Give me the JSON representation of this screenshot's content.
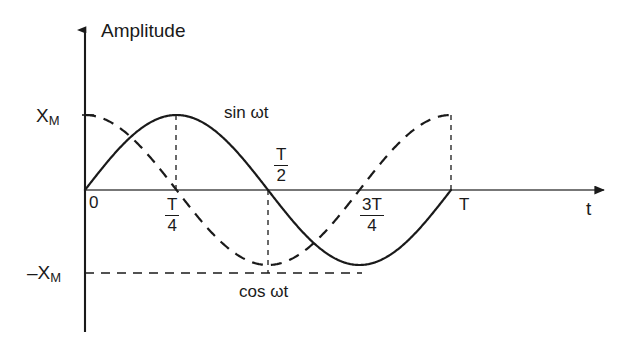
{
  "figure": {
    "background_color": "#ffffff",
    "line_color": "#1a1a1a",
    "y_axis_title": "Amplitude",
    "x_axis_title": "t",
    "origin_label": "0",
    "amplitude_labels": {
      "positive": "X",
      "positive_sub": "M",
      "negative": "–X",
      "negative_sub": "M"
    },
    "tick_labels": {
      "quarter_num": "T",
      "quarter_den": "4",
      "half_num": "T",
      "half_den": "2",
      "three_quarter_num": "3T",
      "three_quarter_den": "4",
      "period": "T"
    },
    "curve_labels": {
      "sine": "sin ωt",
      "cosine": "cos ωt"
    }
  },
  "chart_data": {
    "type": "line",
    "title": "",
    "xlabel": "t",
    "ylabel": "Amplitude",
    "xlim": [
      0,
      1.33
    ],
    "ylim": [
      -1.25,
      1.45
    ],
    "grid": false,
    "legend": "inline-annotations",
    "x_tick_labels": [
      "0",
      "T/4",
      "T/2",
      "3T/4",
      "T"
    ],
    "x_tick_values": [
      0,
      0.25,
      0.5,
      0.75,
      1.0
    ],
    "y_tick_labels": [
      "X_M",
      "0",
      "-X_M"
    ],
    "y_tick_values": [
      1,
      0,
      -1
    ],
    "series": [
      {
        "name": "sin ωt",
        "style": "solid",
        "x": [
          0,
          0.0625,
          0.125,
          0.1875,
          0.25,
          0.3125,
          0.375,
          0.4375,
          0.5,
          0.5625,
          0.625,
          0.6875,
          0.75,
          0.8125,
          0.875,
          0.9375,
          1.0
        ],
        "values": [
          0,
          0.3827,
          0.7071,
          0.9239,
          1.0,
          0.9239,
          0.7071,
          0.3827,
          0,
          -0.3827,
          -0.7071,
          -0.9239,
          -1.0,
          -0.9239,
          -0.7071,
          -0.3827,
          0
        ]
      },
      {
        "name": "cos ωt",
        "style": "dashed",
        "x": [
          0,
          0.0625,
          0.125,
          0.1875,
          0.25,
          0.3125,
          0.375,
          0.4375,
          0.5,
          0.5625,
          0.625,
          0.6875,
          0.75,
          0.8125,
          0.875,
          0.9375,
          1.0
        ],
        "values": [
          1.0,
          0.9239,
          0.7071,
          0.3827,
          0,
          -0.3827,
          -0.7071,
          -0.9239,
          -1.0,
          -0.9239,
          -0.7071,
          -0.3827,
          0,
          0.3827,
          0.7071,
          0.9239,
          1.0
        ]
      }
    ],
    "annotations": [
      {
        "text": "sin ωt",
        "x": 0.55,
        "y": 1.18
      },
      {
        "text": "cos ωt",
        "x": 0.56,
        "y": -1.18
      }
    ],
    "guide_lines": [
      {
        "type": "vertical-dashed",
        "x": 0.25,
        "from_y": 0,
        "to_y": 1.0
      },
      {
        "type": "vertical-dashed",
        "x": 0.5,
        "from_y": 0,
        "to_y": -1.0
      },
      {
        "type": "vertical-dashed",
        "x": 1.0,
        "from_y": 0,
        "to_y": 1.0
      },
      {
        "type": "horizontal-dashed",
        "y": -1.0,
        "from_x": 0,
        "to_x": 0.75
      }
    ]
  }
}
